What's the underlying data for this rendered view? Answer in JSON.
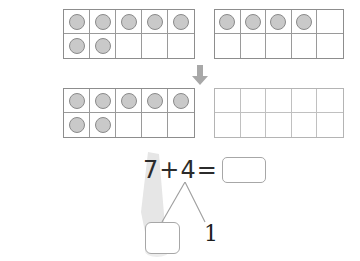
{
  "worksheet": {
    "title": "Ten frame addition with number bond",
    "background_color": "#ffffff"
  },
  "colors": {
    "counter_fill": "#c9c9c9",
    "counter_border": "#8a8a8a",
    "frame_border": "#8d8d8d",
    "frame_border_light": "#b4b4b4",
    "arrow": "#a8a8a8",
    "highlight": "#e4e4e4",
    "box_border": "#a7a7a7",
    "text": "#2b2b2b"
  },
  "ten_frames": [
    {
      "id": "top-left",
      "label": "top-left-ten-frame",
      "rows": 2,
      "columns": 5,
      "filled_count": 7,
      "cells": [
        true,
        true,
        true,
        true,
        true,
        true,
        true,
        false,
        false,
        false
      ]
    },
    {
      "id": "top-right",
      "label": "top-right-ten-frame",
      "rows": 2,
      "columns": 5,
      "filled_count": 4,
      "cells": [
        true,
        true,
        true,
        true,
        false,
        false,
        false,
        false,
        false,
        false
      ]
    },
    {
      "id": "bottom-left",
      "label": "bottom-left-ten-frame",
      "rows": 2,
      "columns": 5,
      "filled_count": 7,
      "cells": [
        true,
        true,
        true,
        true,
        true,
        true,
        true,
        false,
        false,
        false
      ]
    },
    {
      "id": "bottom-right",
      "label": "bottom-right-ten-frame",
      "rows": 2,
      "columns": 5,
      "filled_count": 0,
      "cells": [
        false,
        false,
        false,
        false,
        false,
        false,
        false,
        false,
        false,
        false
      ]
    }
  ],
  "arrow": {
    "direction": "down",
    "icon": "arrow-down-icon"
  },
  "equation": {
    "addend_1": "7",
    "operator_plus": "+",
    "addend_2": "4",
    "operator_equals": "=",
    "sum_value": "",
    "sum_placeholder": ""
  },
  "number_bond": {
    "parent": "4",
    "left_part_value": "",
    "right_part_value": "1"
  },
  "highlight_stroke": {
    "from": "addend-7",
    "to": "number-bond-left-box",
    "color": "#e4e4e4"
  }
}
